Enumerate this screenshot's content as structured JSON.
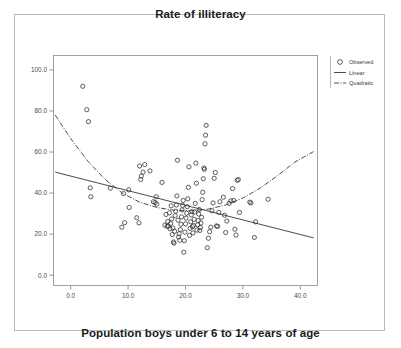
{
  "figure": {
    "title": "Rate of illiteracy",
    "xaxis_caption": "Population boys under 6 to 14 years of age"
  },
  "chart_data": {
    "type": "scatter",
    "title": "Rate of illiteracy",
    "xlabel": "Population boys under 6 to 14 years of age",
    "ylabel": "",
    "xlim": [
      -3.0,
      43.0
    ],
    "ylim": [
      -5.0,
      107.0
    ],
    "xticks": [
      "0.0",
      "10.0",
      "20.0",
      "30.0",
      "40.0"
    ],
    "xtick_values": [
      0,
      10,
      20,
      30,
      40
    ],
    "yticks": [
      "0.0",
      "20.0",
      "40.0",
      "60.0",
      "80.0",
      "100.0"
    ],
    "ytick_values": [
      0,
      20,
      40,
      60,
      80,
      100
    ],
    "grid": false,
    "legend_position": "outside-right-top",
    "legend": [
      {
        "label": "Observed",
        "marker": "circle",
        "style": "marker"
      },
      {
        "label": "Linear",
        "marker": "line",
        "style": "solid"
      },
      {
        "label": "Quadratic",
        "marker": "line",
        "style": "dash-dot"
      }
    ],
    "series": [
      {
        "name": "Observed",
        "marker": "open-circle",
        "color": "#2b2b2b",
        "points": [
          [
            2.1,
            92.0
          ],
          [
            2.8,
            80.6
          ],
          [
            3.1,
            74.8
          ],
          [
            3.4,
            42.6
          ],
          [
            3.5,
            38.2
          ],
          [
            6.9,
            42.4
          ],
          [
            8.9,
            23.4
          ],
          [
            9.2,
            39.8
          ],
          [
            9.4,
            25.6
          ],
          [
            10.1,
            41.6
          ],
          [
            10.2,
            33.0
          ],
          [
            11.5,
            28.0
          ],
          [
            11.9,
            25.5
          ],
          [
            12.0,
            53.2
          ],
          [
            12.2,
            46.6
          ],
          [
            12.3,
            48.3
          ],
          [
            12.6,
            50.2
          ],
          [
            12.9,
            53.9
          ],
          [
            13.8,
            50.8
          ],
          [
            14.4,
            35.8
          ],
          [
            14.7,
            35.4
          ],
          [
            14.9,
            38.2
          ],
          [
            15.0,
            34.6
          ],
          [
            15.9,
            45.2
          ],
          [
            16.4,
            24.4
          ],
          [
            16.6,
            29.6
          ],
          [
            16.8,
            23.8
          ],
          [
            16.9,
            26.2
          ],
          [
            17.0,
            24.0
          ],
          [
            17.2,
            30.4
          ],
          [
            17.3,
            22.6
          ],
          [
            17.4,
            25.2
          ],
          [
            17.5,
            33.8
          ],
          [
            17.6,
            27.4
          ],
          [
            17.7,
            19.8
          ],
          [
            17.8,
            23.0
          ],
          [
            17.9,
            16.2
          ],
          [
            18.0,
            15.6
          ],
          [
            18.1,
            21.4
          ],
          [
            18.2,
            29.0
          ],
          [
            18.3,
            31.2
          ],
          [
            18.4,
            34.2
          ],
          [
            18.5,
            38.6
          ],
          [
            18.6,
            56.0
          ],
          [
            18.7,
            26.8
          ],
          [
            18.8,
            18.6
          ],
          [
            18.9,
            20.2
          ],
          [
            19.0,
            17.0
          ],
          [
            19.1,
            22.2
          ],
          [
            19.2,
            24.8
          ],
          [
            19.3,
            28.4
          ],
          [
            19.4,
            31.8
          ],
          [
            19.5,
            34.0
          ],
          [
            19.6,
            36.4
          ],
          [
            19.7,
            11.2
          ],
          [
            19.8,
            16.8
          ],
          [
            19.9,
            21.0
          ],
          [
            20.0,
            25.0
          ],
          [
            20.1,
            27.8
          ],
          [
            20.2,
            30.2
          ],
          [
            20.3,
            33.4
          ],
          [
            20.4,
            37.2
          ],
          [
            20.5,
            42.8
          ],
          [
            20.6,
            52.8
          ],
          [
            20.7,
            19.4
          ],
          [
            20.8,
            22.8
          ],
          [
            20.9,
            26.0
          ],
          [
            21.0,
            29.4
          ],
          [
            21.1,
            31.0
          ],
          [
            21.2,
            23.6
          ],
          [
            21.3,
            20.6
          ],
          [
            21.4,
            24.2
          ],
          [
            21.5,
            27.2
          ],
          [
            21.6,
            30.8
          ],
          [
            21.7,
            35.0
          ],
          [
            21.8,
            54.6
          ],
          [
            21.9,
            44.8
          ],
          [
            22.0,
            22.0
          ],
          [
            22.1,
            24.6
          ],
          [
            22.2,
            26.6
          ],
          [
            22.3,
            29.8
          ],
          [
            22.4,
            32.0
          ],
          [
            22.5,
            21.8
          ],
          [
            22.6,
            23.2
          ],
          [
            22.7,
            25.4
          ],
          [
            22.8,
            28.2
          ],
          [
            22.9,
            36.8
          ],
          [
            23.0,
            40.4
          ],
          [
            23.1,
            47.0
          ],
          [
            23.2,
            52.2
          ],
          [
            23.3,
            51.6
          ],
          [
            23.4,
            64.0
          ],
          [
            23.5,
            68.2
          ],
          [
            23.6,
            73.0
          ],
          [
            23.8,
            13.4
          ],
          [
            24.0,
            18.0
          ],
          [
            24.2,
            21.2
          ],
          [
            24.4,
            23.4
          ],
          [
            24.6,
            31.4
          ],
          [
            24.8,
            35.2
          ],
          [
            25.0,
            47.2
          ],
          [
            25.2,
            50.0
          ],
          [
            25.4,
            24.0
          ],
          [
            25.6,
            23.8
          ],
          [
            25.8,
            30.6
          ],
          [
            26.0,
            35.8
          ],
          [
            26.6,
            38.0
          ],
          [
            26.8,
            29.2
          ],
          [
            27.0,
            20.8
          ],
          [
            27.2,
            26.4
          ],
          [
            27.6,
            35.0
          ],
          [
            27.9,
            36.2
          ],
          [
            28.2,
            42.2
          ],
          [
            28.4,
            36.4
          ],
          [
            28.6,
            22.4
          ],
          [
            28.8,
            19.6
          ],
          [
            29.0,
            46.2
          ],
          [
            29.2,
            46.6
          ],
          [
            29.4,
            30.6
          ],
          [
            31.2,
            35.6
          ],
          [
            31.4,
            35.2
          ],
          [
            32.0,
            18.4
          ],
          [
            32.2,
            26.0
          ],
          [
            34.4,
            37.0
          ]
        ]
      }
    ],
    "fits": [
      {
        "name": "Linear",
        "style": "solid",
        "equation_points": [
          [
            -2.7,
            50.2
          ],
          [
            42.3,
            18.2
          ]
        ]
      },
      {
        "name": "Quadratic",
        "style": "dash-dot",
        "equation_points": [
          [
            -2.7,
            78.0
          ],
          [
            0.0,
            66.5
          ],
          [
            3.0,
            55.5
          ],
          [
            6.0,
            46.6
          ],
          [
            9.0,
            40.0
          ],
          [
            12.0,
            35.6
          ],
          [
            15.0,
            33.0
          ],
          [
            18.0,
            31.6
          ],
          [
            21.0,
            31.4
          ],
          [
            24.0,
            32.2
          ],
          [
            27.0,
            34.2
          ],
          [
            30.0,
            37.6
          ],
          [
            33.0,
            42.4
          ],
          [
            36.0,
            48.4
          ],
          [
            39.0,
            55.0
          ],
          [
            42.3,
            60.2
          ]
        ]
      }
    ]
  }
}
